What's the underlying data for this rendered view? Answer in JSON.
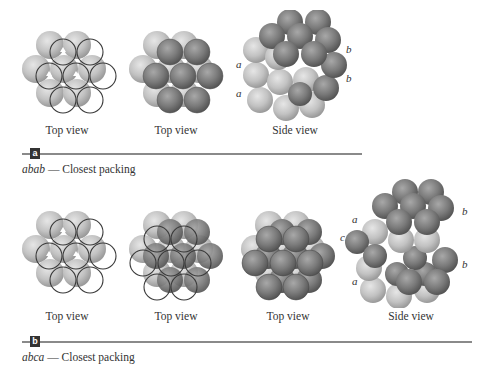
{
  "colors": {
    "layer_a": "#c4c4c4",
    "layer_b": "#7e7e7e",
    "layer_c": "#6a6a6a",
    "outline": "#3a3a3a",
    "rule": "#8a8a8a",
    "badge_bg": "#333333"
  },
  "panel_a": {
    "badge": "a",
    "title_italic": "abab",
    "title_rest": " — Closest packing",
    "figures": [
      {
        "caption": "Top view"
      },
      {
        "caption": "Top view"
      },
      {
        "caption": "Side view"
      }
    ],
    "side_labels_left": [
      "a",
      "a"
    ],
    "side_labels_right": [
      "b",
      "b"
    ]
  },
  "panel_b": {
    "badge": "b",
    "title_italic": "abca",
    "title_rest": " — Closest packing",
    "figures": [
      {
        "caption": "Top view"
      },
      {
        "caption": "Top view"
      },
      {
        "caption": "Top view"
      },
      {
        "caption": "Side view"
      }
    ],
    "side_labels_left": [
      "a",
      "c",
      "a"
    ],
    "side_labels_right": [
      "b",
      "b"
    ]
  }
}
